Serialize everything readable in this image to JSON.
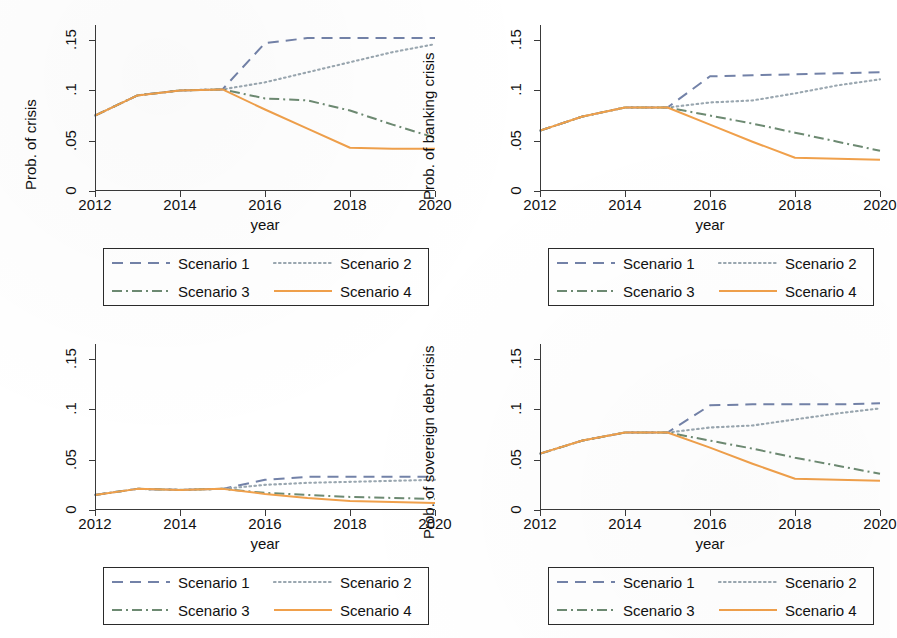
{
  "figure": {
    "background": "#ffffff",
    "panel_count": 4
  },
  "colors": {
    "scenario1": "#7382a8",
    "scenario2": "#9aa7b0",
    "scenario3": "#6d8a72",
    "scenario4": "#f0a04b",
    "axis": "#3a3a3a",
    "text": "#111111"
  },
  "legend": {
    "items": [
      {
        "label": "Scenario 1",
        "style": "dashed",
        "color": "#7382a8"
      },
      {
        "label": "Scenario 2",
        "style": "dotted",
        "color": "#9aa7b0"
      },
      {
        "label": "Scenario 3",
        "style": "dashdotted",
        "color": "#6d8a72"
      },
      {
        "label": "Scenario 4",
        "style": "solid",
        "color": "#f0a04b"
      }
    ]
  },
  "axis": {
    "x_title": "year",
    "x_ticks": [
      "2012",
      "2014",
      "2016",
      "2018",
      "2020"
    ],
    "x_tick_values": [
      2012,
      2014,
      2016,
      2018,
      2020
    ],
    "y_ticks": [
      "0",
      ".05",
      ".1",
      ".15"
    ],
    "y_tick_values": [
      0,
      0.05,
      0.1,
      0.15
    ],
    "xlim": [
      2012,
      2020
    ],
    "ylim": [
      0,
      0.165
    ]
  },
  "panels": {
    "top_left": {
      "ylabel": "Prob. of crisis"
    },
    "top_right": {
      "ylabel": "Prob. of banking crisis"
    },
    "bottom_left": {
      "ylabel": ""
    },
    "bottom_right": {
      "ylabel": "Prob. of sovereign debt crisis"
    }
  },
  "chart_data": [
    {
      "type": "line",
      "panel": "top-left",
      "title": "",
      "xlabel": "year",
      "ylabel": "Prob. of crisis",
      "xlim": [
        2012,
        2020
      ],
      "ylim": [
        0,
        0.165
      ],
      "grid": false,
      "legend_position": "below",
      "x": [
        2012,
        2013,
        2014,
        2015,
        2016,
        2017,
        2018,
        2019,
        2020
      ],
      "series": [
        {
          "name": "Scenario 1",
          "style": "dashed",
          "color": "#7382a8",
          "values": [
            0.075,
            0.095,
            0.1,
            0.101,
            0.147,
            0.152,
            0.152,
            0.152,
            0.152
          ]
        },
        {
          "name": "Scenario 2",
          "style": "dotted",
          "color": "#9aa7b0",
          "values": [
            0.075,
            0.095,
            0.1,
            0.101,
            0.108,
            0.118,
            0.128,
            0.138,
            0.146
          ]
        },
        {
          "name": "Scenario 3",
          "style": "dashdotted",
          "color": "#6d8a72",
          "values": [
            0.075,
            0.095,
            0.1,
            0.101,
            0.092,
            0.09,
            0.08,
            0.066,
            0.053
          ]
        },
        {
          "name": "Scenario 4",
          "style": "solid",
          "color": "#f0a04b",
          "values": [
            0.075,
            0.095,
            0.1,
            0.101,
            0.081,
            0.062,
            0.043,
            0.042,
            0.042
          ]
        }
      ]
    },
    {
      "type": "line",
      "panel": "top-right",
      "title": "",
      "xlabel": "year",
      "ylabel": "Prob. of banking crisis",
      "xlim": [
        2012,
        2020
      ],
      "ylim": [
        0,
        0.165
      ],
      "grid": false,
      "legend_position": "below",
      "x": [
        2012,
        2013,
        2014,
        2015,
        2016,
        2017,
        2018,
        2019,
        2020
      ],
      "series": [
        {
          "name": "Scenario 1",
          "style": "dashed",
          "color": "#7382a8",
          "values": [
            0.06,
            0.074,
            0.083,
            0.083,
            0.114,
            0.115,
            0.116,
            0.117,
            0.118
          ]
        },
        {
          "name": "Scenario 2",
          "style": "dotted",
          "color": "#9aa7b0",
          "values": [
            0.06,
            0.074,
            0.083,
            0.083,
            0.088,
            0.09,
            0.097,
            0.105,
            0.111
          ]
        },
        {
          "name": "Scenario 3",
          "style": "dashdotted",
          "color": "#6d8a72",
          "values": [
            0.06,
            0.074,
            0.083,
            0.083,
            0.075,
            0.067,
            0.058,
            0.049,
            0.04
          ]
        },
        {
          "name": "Scenario 4",
          "style": "solid",
          "color": "#f0a04b",
          "values": [
            0.06,
            0.074,
            0.083,
            0.083,
            0.066,
            0.049,
            0.033,
            0.032,
            0.031
          ]
        }
      ]
    },
    {
      "type": "line",
      "panel": "bottom-left",
      "title": "",
      "xlabel": "year",
      "ylabel": "",
      "xlim": [
        2012,
        2020
      ],
      "ylim": [
        0,
        0.165
      ],
      "grid": false,
      "legend_position": "below",
      "x": [
        2012,
        2013,
        2014,
        2015,
        2016,
        2017,
        2018,
        2019,
        2020
      ],
      "series": [
        {
          "name": "Scenario 1",
          "style": "dashed",
          "color": "#7382a8",
          "values": [
            0.015,
            0.021,
            0.02,
            0.021,
            0.03,
            0.033,
            0.033,
            0.033,
            0.033
          ]
        },
        {
          "name": "Scenario 2",
          "style": "dotted",
          "color": "#9aa7b0",
          "values": [
            0.015,
            0.021,
            0.02,
            0.021,
            0.025,
            0.027,
            0.028,
            0.029,
            0.03
          ]
        },
        {
          "name": "Scenario 3",
          "style": "dashdotted",
          "color": "#6d8a72",
          "values": [
            0.015,
            0.021,
            0.02,
            0.021,
            0.017,
            0.015,
            0.013,
            0.012,
            0.011
          ]
        },
        {
          "name": "Scenario 4",
          "style": "solid",
          "color": "#f0a04b",
          "values": [
            0.015,
            0.021,
            0.02,
            0.021,
            0.016,
            0.012,
            0.009,
            0.008,
            0.007
          ]
        }
      ]
    },
    {
      "type": "line",
      "panel": "bottom-right",
      "title": "",
      "xlabel": "year",
      "ylabel": "Prob. of sovereign debt crisis",
      "xlim": [
        2012,
        2020
      ],
      "ylim": [
        0,
        0.165
      ],
      "grid": false,
      "legend_position": "below",
      "x": [
        2012,
        2013,
        2014,
        2015,
        2016,
        2017,
        2018,
        2019,
        2020
      ],
      "series": [
        {
          "name": "Scenario 1",
          "style": "dashed",
          "color": "#7382a8",
          "values": [
            0.056,
            0.069,
            0.077,
            0.077,
            0.104,
            0.105,
            0.105,
            0.105,
            0.106
          ]
        },
        {
          "name": "Scenario 2",
          "style": "dotted",
          "color": "#9aa7b0",
          "values": [
            0.056,
            0.069,
            0.077,
            0.077,
            0.082,
            0.084,
            0.09,
            0.096,
            0.101
          ]
        },
        {
          "name": "Scenario 3",
          "style": "dashdotted",
          "color": "#6d8a72",
          "values": [
            0.056,
            0.069,
            0.077,
            0.077,
            0.069,
            0.061,
            0.052,
            0.044,
            0.036
          ]
        },
        {
          "name": "Scenario 4",
          "style": "solid",
          "color": "#f0a04b",
          "values": [
            0.056,
            0.069,
            0.077,
            0.077,
            0.062,
            0.046,
            0.031,
            0.03,
            0.029
          ]
        }
      ]
    }
  ]
}
